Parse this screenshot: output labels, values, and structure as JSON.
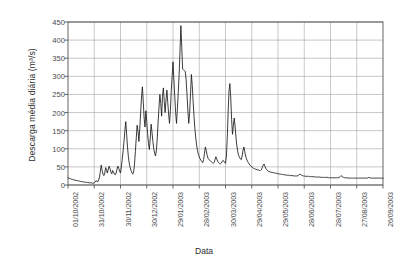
{
  "chart_data": {
    "type": "line",
    "title": "",
    "xlabel": "Data",
    "ylabel": "Descarga média diária (m³/s)",
    "ylim": [
      0,
      450
    ],
    "ytick_values": [
      0,
      50,
      100,
      150,
      200,
      250,
      300,
      350,
      400,
      450
    ],
    "grid": true,
    "legend": "none",
    "line_color": "#1a1a1a",
    "grid_color": "#9a9a9a",
    "axis_color": "#555555",
    "xtick_labels": [
      "01/10/2002",
      "31/10/2002",
      "30/11/2002",
      "30/12/2002",
      "29/01/2003",
      "28/02/2003",
      "30/03/2003",
      "29/04/2003",
      "29/05/2003",
      "28/06/2003",
      "28/07/2003",
      "27/08/2003",
      "26/09/2003"
    ],
    "x_start_date": "01/10/2002",
    "x_end_date": "26/09/2003",
    "x_tick_interval_days": 30,
    "series": [
      {
        "name": "Descarga média diária",
        "units": "m³/s",
        "values": [
          20,
          19,
          18,
          17,
          16,
          15,
          15,
          14,
          13,
          13,
          12,
          12,
          11,
          11,
          10,
          10,
          9,
          9,
          8,
          8,
          8,
          7,
          7,
          7,
          6,
          6,
          6,
          6,
          5,
          5,
          6,
          8,
          12,
          10,
          9,
          14,
          22,
          38,
          55,
          40,
          30,
          26,
          33,
          48,
          42,
          33,
          44,
          52,
          45,
          36,
          31,
          40,
          36,
          30,
          28,
          33,
          44,
          52,
          46,
          38,
          33,
          50,
          72,
          95,
          120,
          150,
          175,
          140,
          105,
          78,
          60,
          48,
          40,
          34,
          30,
          36,
          58,
          92,
          130,
          165,
          150,
          120,
          155,
          200,
          240,
          271,
          230,
          185,
          160,
          205,
          175,
          140,
          115,
          98,
          130,
          168,
          145,
          120,
          100,
          88,
          80,
          95,
          130,
          175,
          215,
          250,
          225,
          190,
          245,
          268,
          230,
          200,
          235,
          262,
          228,
          196,
          170,
          205,
          260,
          300,
          340,
          290,
          245,
          200,
          170,
          210,
          255,
          305,
          370,
          440,
          380,
          320,
          318,
          316,
          314,
          290,
          250,
          205,
          170,
          200,
          250,
          305,
          275,
          230,
          190,
          155,
          130,
          110,
          95,
          85,
          78,
          72,
          68,
          64,
          62,
          70,
          88,
          105,
          95,
          82,
          74,
          70,
          68,
          66,
          64,
          62,
          60,
          62,
          70,
          78,
          72,
          66,
          62,
          60,
          58,
          60,
          64,
          68,
          66,
          62,
          60,
          80,
          130,
          200,
          260,
          280,
          240,
          180,
          140,
          165,
          185,
          160,
          130,
          108,
          92,
          82,
          76,
          72,
          70,
          80,
          95,
          105,
          92,
          80,
          72,
          66,
          62,
          58,
          55,
          52,
          50,
          48,
          46,
          45,
          44,
          43,
          42,
          42,
          41,
          40,
          40,
          42,
          48,
          55,
          58,
          52,
          46,
          42,
          40,
          38,
          37,
          36,
          35,
          35,
          34,
          34,
          33,
          33,
          32,
          32,
          31,
          31,
          30,
          30,
          29,
          29,
          29,
          28,
          28,
          28,
          27,
          27,
          27,
          27,
          26,
          26,
          26,
          26,
          25,
          25,
          25,
          25,
          25,
          26,
          28,
          30,
          29,
          27,
          26,
          25,
          25,
          24,
          24,
          24,
          24,
          24,
          23,
          23,
          23,
          23,
          23,
          23,
          22,
          22,
          22,
          22,
          22,
          22,
          22,
          21,
          21,
          21,
          21,
          21,
          21,
          21,
          21,
          21,
          20,
          20,
          20,
          20,
          20,
          20,
          20,
          20,
          20,
          20,
          20,
          20,
          21,
          23,
          26,
          24,
          22,
          21,
          20,
          20,
          20,
          20,
          19,
          19,
          19,
          19,
          19,
          19,
          19,
          19,
          19,
          19,
          19,
          19,
          19,
          19,
          19,
          19,
          19,
          19,
          19,
          19,
          19,
          19,
          19,
          20,
          21,
          20,
          19,
          19,
          19,
          19,
          19,
          19,
          19,
          19,
          19,
          19,
          19,
          19,
          19,
          19,
          19
        ]
      }
    ]
  },
  "axes": {
    "plot_left_px": 68,
    "plot_right_px": 383,
    "plot_top_px": 22,
    "plot_bottom_px": 185
  }
}
